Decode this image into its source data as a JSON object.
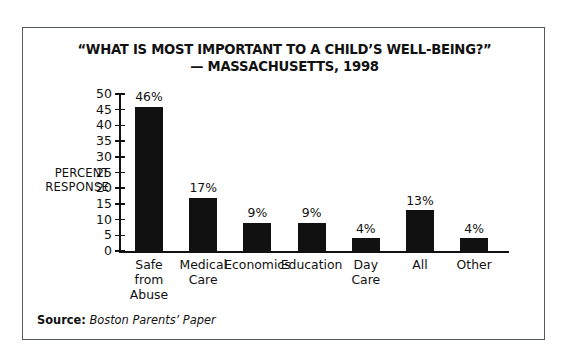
{
  "figure": {
    "border_color": "#555a5d",
    "background": "#ffffff"
  },
  "title": {
    "line1": "“WHAT IS MOST IMPORTANT TO A CHILD’S WELL-BEING?”",
    "line2": "— MASSACHUSETTS, 1998"
  },
  "axis": {
    "y_name_line1": "PERCENT",
    "y_name_line2": "RESPONSE",
    "ticks": [
      "50",
      "45",
      "40",
      "35",
      "30",
      "25",
      "20",
      "15",
      "10",
      "5",
      "0"
    ]
  },
  "source": {
    "label": "Source:",
    "text": "Boston Parents’ Paper"
  },
  "chart_data": {
    "type": "bar",
    "title": "“WHAT IS MOST IMPORTANT TO A CHILD’S WELL-BEING?” — MASSACHUSETTS, 1998",
    "xlabel": "",
    "ylabel": "PERCENT RESPONSE",
    "ylim": [
      0,
      50
    ],
    "ytick_step": 5,
    "grid": false,
    "legend": "none",
    "bar_color": "#111111",
    "source": "Source: Boston Parents' Paper",
    "categories": [
      "Safe from Abuse",
      "Medical Care",
      "Economics",
      "Education",
      "Day Care",
      "All",
      "Other"
    ],
    "category_lines": [
      [
        "Safe",
        "from",
        "Abuse"
      ],
      [
        "Medical",
        "Care"
      ],
      [
        "Economics"
      ],
      [
        "Education"
      ],
      [
        "Day",
        "Care"
      ],
      [
        "All"
      ],
      [
        "Other"
      ]
    ],
    "values": [
      46,
      17,
      9,
      9,
      4,
      13,
      4
    ],
    "value_labels": [
      "46%",
      "17%",
      "9%",
      "9%",
      "4%",
      "13%",
      "4%"
    ]
  }
}
